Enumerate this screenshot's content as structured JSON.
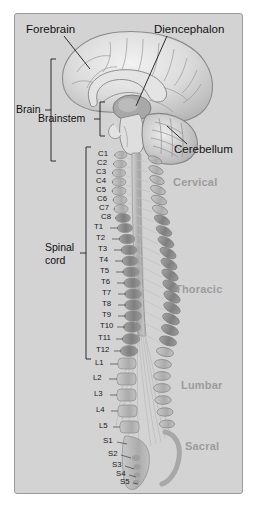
{
  "figure": {
    "background_color": "#d3d3d3",
    "border_color": "#9a9a9a",
    "page_background": "#ffffff"
  },
  "brain_labels": {
    "forebrain": "Forebrain",
    "diencephalon": "Diencephalon",
    "cerebellum": "Cerebellum"
  },
  "brackets": {
    "brain": "Brain",
    "brainstem": "Brainstem",
    "spinal_cord_line1": "Spinal",
    "spinal_cord_line2": "cord"
  },
  "regions": [
    {
      "name": "Cervical",
      "color": "#9c9c9c"
    },
    {
      "name": "Thoracic",
      "color": "#9c9c9c"
    },
    {
      "name": "Lumbar",
      "color": "#9c9c9c"
    },
    {
      "name": "Sacral",
      "color": "#9c9c9c"
    }
  ],
  "vertebrae": {
    "cervical": [
      "C1",
      "C2",
      "C3",
      "C4",
      "C5",
      "C6",
      "C7",
      "C8"
    ],
    "thoracic": [
      "T1",
      "T2",
      "T3",
      "T4",
      "T5",
      "T6",
      "T7",
      "T8",
      "T9",
      "T10",
      "T11",
      "T12"
    ],
    "lumbar": [
      "L1",
      "L2",
      "L3",
      "L4",
      "L5"
    ],
    "sacral": [
      "S1",
      "S2",
      "S3",
      "S4",
      "S5"
    ]
  },
  "colors": {
    "cortex_light": "#e8e8e8",
    "cortex_mid": "#c9c9c9",
    "cortex_line": "#8f8f8f",
    "vertebra_body": "#b4b4b4",
    "vertebra_dark": "#8e8e8e",
    "cord": "#b9b9b9",
    "nerve": "#c4c4c4",
    "leader": "#1a1a1a"
  }
}
